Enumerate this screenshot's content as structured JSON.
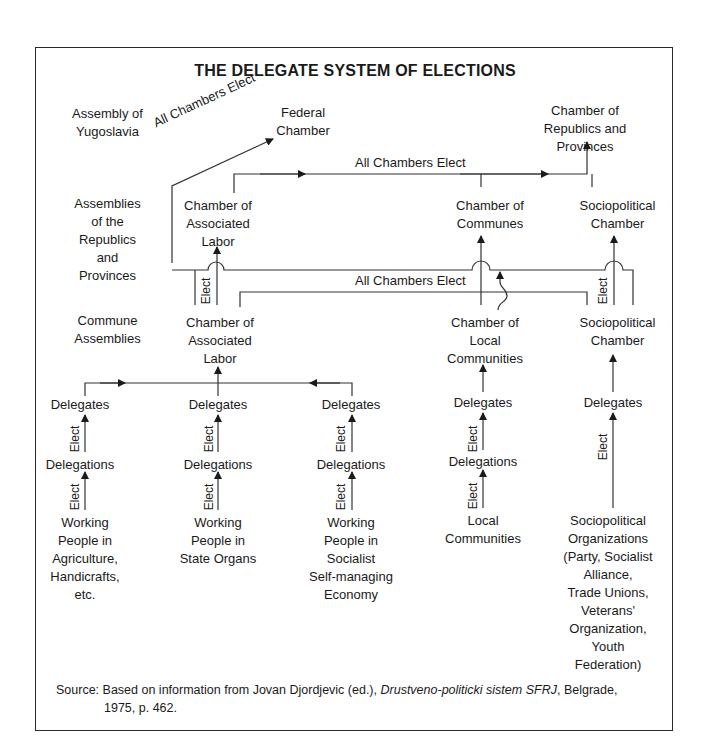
{
  "title": "THE DELEGATE SYSTEM OF ELECTIONS",
  "levels": {
    "federal": "Assembly of\nYugoslavia",
    "republics": "Assemblies\nof the\nRepublics\nand\nProvinces",
    "commune": "Commune\nAssemblies"
  },
  "federal_level": {
    "federal_chamber": "Federal\nChamber",
    "chamber_republics": "Chamber of\nRepublics and\nProvinces"
  },
  "republic_level": {
    "associated_labor": "Chamber of\nAssociated\nLabor",
    "communes": "Chamber of\nCommunes",
    "sociopolitical": "Sociopolitical\nChamber"
  },
  "commune_level": {
    "associated_labor": "Chamber of\nAssociated\nLabor",
    "local_communities": "Chamber of\nLocal\nCommunities",
    "sociopolitical": "Sociopolitical\nChamber"
  },
  "connectors": {
    "all_chambers_elect": "All Chambers Elect",
    "elect": "Elect"
  },
  "columns": [
    {
      "delegates": "Delegates",
      "delegations": "Delegations",
      "base": "Working\nPeople in\nAgriculture,\nHandicrafts,\netc."
    },
    {
      "delegates": "Delegates",
      "delegations": "Delegations",
      "base": "Working\nPeople in\nState Organs"
    },
    {
      "delegates": "Delegates",
      "delegations": "Delegations",
      "base": "Working\nPeople in\nSocialist\nSelf-managing\nEconomy"
    },
    {
      "delegates": "Delegates",
      "delegations": "Delegations",
      "base": "Local\nCommunities"
    },
    {
      "delegates": "Delegates",
      "base": "Sociopolitical\nOrganizations\n(Party, Socialist\nAlliance,\nTrade Unions,\nVeterans'\nOrganization,\nYouth\nFederation)"
    }
  ],
  "source": {
    "prefix": "Source:",
    "text_before": "Based on information from Jovan Djordjevic (ed.),",
    "italic": "Drustveno-politicki sistem SFRJ",
    "text_after": ", Belgrade,",
    "line2": "1975,  p. 462."
  }
}
